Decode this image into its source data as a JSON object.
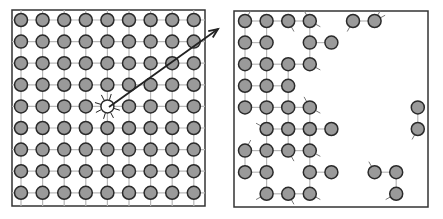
{
  "figure": {
    "left_panel": {
      "label": "intact-lattice",
      "rows": 9,
      "cols": 9,
      "struck_atom": {
        "row": 4,
        "col": 4
      },
      "arrow": {
        "from": [
          109,
          107
        ],
        "to": [
          218,
          29
        ]
      }
    },
    "right_panel": {
      "label": "damaged-lattice",
      "remaining_atoms": [
        [
          0,
          0
        ],
        [
          0,
          1
        ],
        [
          0,
          2
        ],
        [
          0,
          3
        ],
        [
          0,
          5
        ],
        [
          0,
          6
        ],
        [
          1,
          0
        ],
        [
          1,
          1
        ],
        [
          1,
          3
        ],
        [
          1,
          4
        ],
        [
          2,
          0
        ],
        [
          2,
          1
        ],
        [
          2,
          2
        ],
        [
          2,
          3
        ],
        [
          3,
          0
        ],
        [
          3,
          1
        ],
        [
          3,
          2
        ],
        [
          4,
          0
        ],
        [
          4,
          1
        ],
        [
          4,
          2
        ],
        [
          4,
          3
        ],
        [
          4,
          8
        ],
        [
          5,
          1
        ],
        [
          5,
          2
        ],
        [
          5,
          3
        ],
        [
          5,
          4
        ],
        [
          5,
          8
        ],
        [
          6,
          0
        ],
        [
          6,
          1
        ],
        [
          6,
          2
        ],
        [
          6,
          3
        ],
        [
          7,
          0
        ],
        [
          7,
          1
        ],
        [
          7,
          3
        ],
        [
          7,
          4
        ],
        [
          7,
          6
        ],
        [
          7,
          7
        ],
        [
          8,
          1
        ],
        [
          8,
          2
        ],
        [
          8,
          3
        ],
        [
          8,
          7
        ]
      ]
    },
    "colors": {
      "atom_fill": "#9a9a9a",
      "atom_stroke": "#2a2a2a",
      "bond": "#b8b8b8",
      "frame": "#333333",
      "arrow": "#222222"
    }
  }
}
